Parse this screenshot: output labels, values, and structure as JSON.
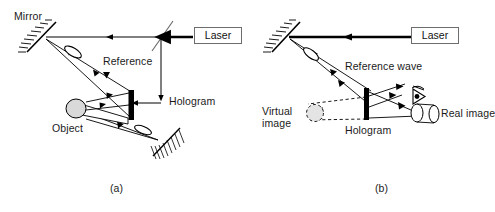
{
  "figure": {
    "background": "#ffffff",
    "stroke_color": "#000000",
    "text_color": "#1a1a1a",
    "object_fill": "#d9d9d9"
  },
  "panel_a": {
    "caption": "(a)",
    "labels": {
      "mirror": "Mirror",
      "laser": "Laser",
      "reference": "Reference",
      "hologram": "Hologram",
      "object": "Object"
    }
  },
  "panel_b": {
    "caption": "(b)",
    "labels": {
      "laser": "Laser",
      "reference_wave": "Reference wave",
      "virtual_image_line1": "Virtual",
      "virtual_image_line2": "image",
      "hologram": "Hologram",
      "real_image": "Real image"
    }
  },
  "icons": {
    "mirror_a": "mirror-hatched-icon",
    "mirror_b": "mirror-hatched-icon",
    "mirror_lower_a": "mirror-hatched-icon",
    "beam_splitter": "beam-splitter-icon",
    "lens_reference_a": "lens-ellipse-icon",
    "lens_object_a": "lens-ellipse-icon",
    "lens_reference_b": "lens-ellipse-icon",
    "hologram_plate_a": "hologram-plate-icon",
    "hologram_plate_b": "hologram-plate-icon",
    "object_cylinder": "object-cylinder-icon",
    "virtual_image_cylinder": "virtual-image-dashed-cylinder-icon",
    "real_image_cylinder": "real-image-cylinder-icon",
    "eye": "eye-icon",
    "beam_arrow": "beam-arrow-icon"
  }
}
